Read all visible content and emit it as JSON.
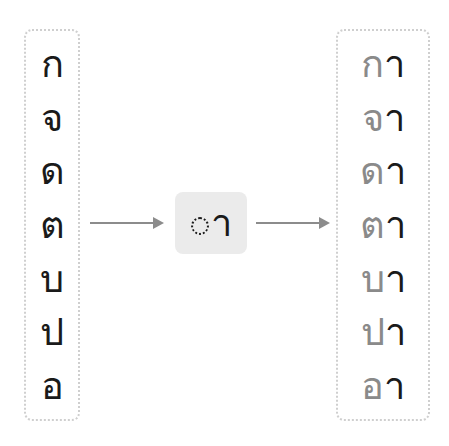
{
  "diagram": {
    "consonants": [
      "ก",
      "จ",
      "ด",
      "ต",
      "บ",
      "ป",
      "อ"
    ],
    "vowel": {
      "symbol": "า",
      "placeholder": "dotted-circle"
    },
    "results": [
      {
        "consonant": "ก",
        "vowel": "า"
      },
      {
        "consonant": "จ",
        "vowel": "า"
      },
      {
        "consonant": "ด",
        "vowel": "า"
      },
      {
        "consonant": "ต",
        "vowel": "า"
      },
      {
        "consonant": "บ",
        "vowel": "า"
      },
      {
        "consonant": "ป",
        "vowel": "า"
      },
      {
        "consonant": "อ",
        "vowel": "า"
      }
    ],
    "colors": {
      "consonant_input": "#1a1a1a",
      "consonant_output": "#8a8a8a",
      "vowel": "#1a1a1a",
      "arrow": "#8c8c8c",
      "middle_box_bg": "#ebebeb",
      "box_border": "#cfcfcf"
    }
  }
}
